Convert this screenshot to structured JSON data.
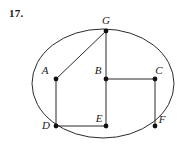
{
  "problem": {
    "number": "17."
  },
  "figure": {
    "type": "geometry-diagram",
    "stroke_color": "#2b2b2b",
    "point_color": "#111111",
    "background_color": "#ffffff",
    "circle": {
      "cx": 103,
      "cy": 83.5,
      "r": 71,
      "left": 32,
      "right": 174,
      "top": 29,
      "bottom": 138
    },
    "points": [
      {
        "id": "A",
        "label": "A",
        "x": 56,
        "y": 79,
        "label_x": 45,
        "label_y": 74
      },
      {
        "id": "B",
        "label": "B",
        "x": 106,
        "y": 79,
        "label_x": 95,
        "label_y": 74
      },
      {
        "id": "C",
        "label": "C",
        "x": 155,
        "y": 79,
        "label_x": 157,
        "label_y": 74
      },
      {
        "id": "D",
        "label": "D",
        "x": 56,
        "y": 126,
        "label_x": 44,
        "label_y": 126
      },
      {
        "id": "E",
        "label": "E",
        "x": 106,
        "y": 126,
        "label_x": 95,
        "label_y": 122
      },
      {
        "id": "F",
        "label": "F",
        "x": 155,
        "y": 126,
        "label_x": 159,
        "label_y": 122
      },
      {
        "id": "G",
        "label": "G",
        "x": 106,
        "y": 31,
        "label_x": 102,
        "label_y": 24
      }
    ],
    "segments": [
      {
        "name": "G-A",
        "from": "G",
        "to": "A"
      },
      {
        "name": "G-B",
        "from": "G",
        "to": "B"
      },
      {
        "name": "B-E",
        "from": "B",
        "to": "E"
      },
      {
        "name": "A-D",
        "from": "A",
        "to": "D"
      },
      {
        "name": "D-E",
        "from": "D",
        "to": "E"
      },
      {
        "name": "B-C",
        "from": "B",
        "to": "C"
      },
      {
        "name": "C-F",
        "from": "C",
        "to": "F"
      }
    ]
  }
}
